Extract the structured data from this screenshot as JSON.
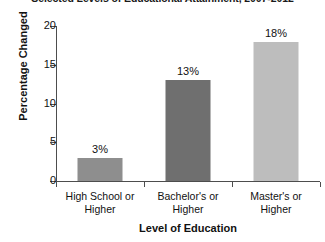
{
  "chart_data": {
    "type": "bar",
    "title": "Selected Levels of Educational Attainment, 2007-2012",
    "xlabel": "Level of Education",
    "ylabel": "Percentage Changed",
    "categories": [
      "High School or Higher",
      "Bachelor's or Higher",
      "Master's or Higher"
    ],
    "category_lines": [
      [
        "High School or",
        "Higher"
      ],
      [
        "Bachelor's or",
        "Higher"
      ],
      [
        "Master's or",
        "Higher"
      ]
    ],
    "values": [
      3,
      13,
      18
    ],
    "value_labels": [
      "3%",
      "13%",
      "18%"
    ],
    "bar_colors": [
      "#8e8e8e",
      "#6f6f6f",
      "#bdbdbd"
    ],
    "ylim": [
      0,
      20
    ],
    "yticks": [
      0,
      5,
      10,
      15,
      20
    ],
    "ytick_labels": [
      "0",
      "5",
      "10",
      "15",
      "20"
    ],
    "grid": false,
    "legend": false
  },
  "style": {
    "axis_color": "#4d4d4d",
    "text_color": "#111111",
    "background": "#ffffff"
  }
}
